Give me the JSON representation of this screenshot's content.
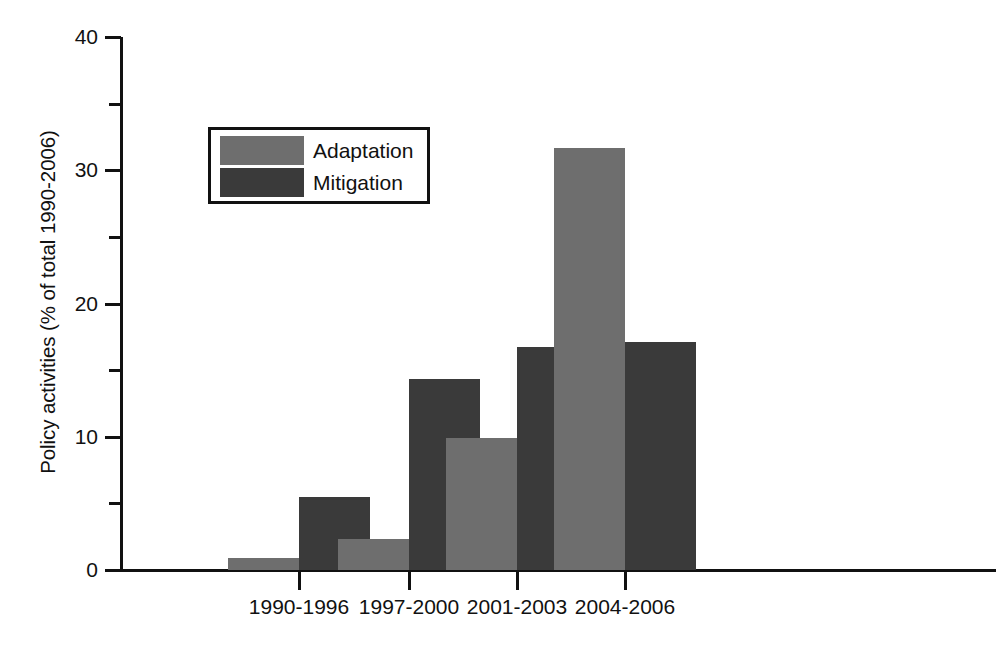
{
  "chart_data": {
    "type": "bar",
    "title": "",
    "subtitle": "",
    "xlabel": "",
    "ylabel": "Policy activities (% of total 1990-2006)",
    "categories": [
      "1990-1996",
      "1997-2000",
      "2001-2003",
      "2004-2006"
    ],
    "series": [
      {
        "name": "Adaptation",
        "color": "#6e6e6e",
        "values": [
          0.9,
          2.3,
          9.9,
          31.7
        ]
      },
      {
        "name": "Mitigation",
        "color": "#3a3a3a",
        "values": [
          5.5,
          14.3,
          16.7,
          17.1
        ]
      }
    ],
    "ylim": [
      0,
      40
    ],
    "yticks": [
      0,
      10,
      20,
      30,
      40
    ],
    "ytick_labels": [
      "0",
      "10",
      "20",
      "30",
      "40"
    ],
    "yticks_minor": [
      5,
      15,
      25,
      35
    ],
    "grid": false,
    "legend_position": "upper-left",
    "legend_entries": [
      "Adaptation",
      "Mitigation"
    ],
    "axis_color": "#111111",
    "background": "#ffffff"
  }
}
